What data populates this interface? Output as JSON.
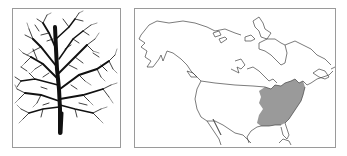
{
  "figure": {
    "tree_panel": {
      "label": "Tree silhouette (leafless, winter form)",
      "colors": {
        "tree": "#111111",
        "background": "#ffffff",
        "border": "#9a9a9a"
      }
    },
    "map_panel": {
      "label": "Range map of North America",
      "region": "North America (Alaska, Canada, United States, Mexico)",
      "shaded_range": "Eastern United States — Great Lakes south to Gulf Coast, east to Atlantic, west to Great Plains",
      "colors": {
        "range_fill": "#9a9a9a",
        "outline": "#444444",
        "background": "#ffffff",
        "border": "#9a9a9a"
      }
    }
  }
}
